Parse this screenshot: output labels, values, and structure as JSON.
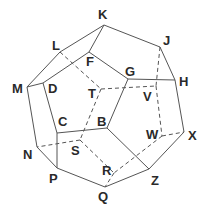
{
  "diagram": {
    "colors": {
      "line": "#555555",
      "label": "#2a2a2a",
      "background": "#ffffff"
    },
    "vertices": [
      {
        "id": "K",
        "x": 104,
        "y": 25,
        "lx": 98,
        "ly": 19,
        "hidden": false
      },
      {
        "id": "L",
        "x": 60,
        "y": 52,
        "lx": 52,
        "ly": 50,
        "hidden": false
      },
      {
        "id": "F",
        "x": 89,
        "y": 52,
        "lx": 86,
        "ly": 66,
        "hidden": false
      },
      {
        "id": "J",
        "x": 160,
        "y": 47,
        "lx": 163,
        "ly": 45,
        "hidden": false
      },
      {
        "id": "G",
        "x": 128,
        "y": 79,
        "lx": 125,
        "ly": 76,
        "hidden": false
      },
      {
        "id": "H",
        "x": 175,
        "y": 80,
        "lx": 179,
        "ly": 86,
        "hidden": false
      },
      {
        "id": "M",
        "x": 27,
        "y": 87,
        "lx": 12,
        "ly": 93,
        "hidden": false
      },
      {
        "id": "D",
        "x": 43,
        "y": 83,
        "lx": 48,
        "ly": 93,
        "hidden": false
      },
      {
        "id": "T",
        "x": 101,
        "y": 89,
        "lx": 88,
        "ly": 98,
        "hidden": true
      },
      {
        "id": "V",
        "x": 156,
        "y": 86,
        "lx": 143,
        "ly": 101,
        "hidden": true
      },
      {
        "id": "C",
        "x": 57,
        "y": 133,
        "lx": 58,
        "ly": 126,
        "hidden": false
      },
      {
        "id": "B",
        "x": 107,
        "y": 128,
        "lx": 97,
        "ly": 126,
        "hidden": false
      },
      {
        "id": "S",
        "x": 80,
        "y": 140,
        "lx": 71,
        "ly": 155,
        "hidden": true
      },
      {
        "id": "W",
        "x": 162,
        "y": 136,
        "lx": 146,
        "ly": 139,
        "hidden": true
      },
      {
        "id": "X",
        "x": 184,
        "y": 132,
        "lx": 188,
        "ly": 140,
        "hidden": false
      },
      {
        "id": "N",
        "x": 37,
        "y": 147,
        "lx": 23,
        "ly": 159,
        "hidden": false
      },
      {
        "id": "P",
        "x": 57,
        "y": 168,
        "lx": 49,
        "ly": 183,
        "hidden": false
      },
      {
        "id": "R",
        "x": 114,
        "y": 173,
        "lx": 102,
        "ly": 175,
        "hidden": true
      },
      {
        "id": "Q",
        "x": 105,
        "y": 187,
        "lx": 98,
        "ly": 201,
        "hidden": false
      },
      {
        "id": "Z",
        "x": 149,
        "y": 169,
        "lx": 151,
        "ly": 185,
        "hidden": false
      }
    ],
    "solid_edges": [
      [
        "K",
        "L"
      ],
      [
        "K",
        "F"
      ],
      [
        "K",
        "J"
      ],
      [
        "L",
        "M"
      ],
      [
        "F",
        "D"
      ],
      [
        "F",
        "G"
      ],
      [
        "J",
        "H"
      ],
      [
        "G",
        "H"
      ],
      [
        "G",
        "B"
      ],
      [
        "M",
        "D"
      ],
      [
        "M",
        "N"
      ],
      [
        "D",
        "C"
      ],
      [
        "C",
        "B"
      ],
      [
        "C",
        "P"
      ],
      [
        "N",
        "P"
      ],
      [
        "P",
        "Q"
      ],
      [
        "Q",
        "Z"
      ],
      [
        "B",
        "Z"
      ],
      [
        "Z",
        "X"
      ],
      [
        "H",
        "X"
      ]
    ],
    "dashed_edges": [
      [
        "L",
        "T"
      ],
      [
        "T",
        "V"
      ],
      [
        "T",
        "S"
      ],
      [
        "J",
        "V"
      ],
      [
        "V",
        "W"
      ],
      [
        "W",
        "X"
      ],
      [
        "W",
        "R"
      ],
      [
        "S",
        "N"
      ],
      [
        "S",
        "R"
      ],
      [
        "R",
        "Q"
      ]
    ]
  }
}
